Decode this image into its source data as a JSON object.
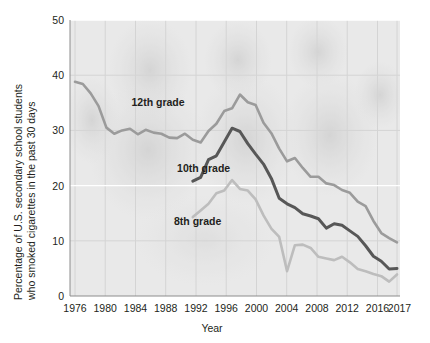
{
  "chart_data": {
    "type": "line",
    "title": "",
    "xlabel": "Year",
    "ylabel": "Percentage of U.S. secondary school students who smoked cigarettes in the past 30 days",
    "xlim": [
      1976,
      2017
    ],
    "ylim": [
      0,
      50
    ],
    "xticks": [
      1976,
      1980,
      1984,
      1988,
      1992,
      1996,
      2000,
      2004,
      2008,
      2012,
      2016,
      2017
    ],
    "xtick_labels": [
      "1976",
      "1980",
      "1984",
      "1988",
      "1992",
      "1996",
      "2000",
      "2004",
      "2008",
      "2012",
      "2016",
      "2017"
    ],
    "yticks": [
      0,
      10,
      20,
      30,
      40,
      50
    ],
    "ytick_labels": [
      "0",
      "10",
      "20",
      "30",
      "40",
      "50"
    ],
    "grid": true,
    "legend_position": "inline-annotations",
    "series": [
      {
        "name": "12th grade",
        "color": "#9b9b9b",
        "label_x": 1983.2,
        "label_y": 34.5,
        "x": [
          1976,
          1977,
          1978,
          1979,
          1980,
          1981,
          1982,
          1983,
          1984,
          1985,
          1986,
          1987,
          1988,
          1989,
          1990,
          1991,
          1992,
          1993,
          1994,
          1995,
          1996,
          1997,
          1998,
          1999,
          2000,
          2001,
          2002,
          2003,
          2004,
          2005,
          2006,
          2007,
          2008,
          2009,
          2010,
          2011,
          2012,
          2013,
          2014,
          2015,
          2016,
          2017
        ],
        "y": [
          38.8,
          38.4,
          36.7,
          34.4,
          30.5,
          29.4,
          30.0,
          30.3,
          29.3,
          30.1,
          29.6,
          29.4,
          28.7,
          28.6,
          29.4,
          28.3,
          27.8,
          29.9,
          31.2,
          33.5,
          34.0,
          36.5,
          35.1,
          34.6,
          31.4,
          29.5,
          26.7,
          24.4,
          25.0,
          23.2,
          21.6,
          21.6,
          20.4,
          20.1,
          19.2,
          18.7,
          17.1,
          16.3,
          13.6,
          11.4,
          10.5,
          9.7
        ]
      },
      {
        "name": "10th grade",
        "color": "#575757",
        "label_x": 1989.0,
        "label_y": 22.5,
        "x": [
          1991,
          1992,
          1993,
          1994,
          1995,
          1996,
          1997,
          1998,
          1999,
          2000,
          2001,
          2002,
          2003,
          2004,
          2005,
          2006,
          2007,
          2008,
          2009,
          2010,
          2011,
          2012,
          2013,
          2014,
          2015,
          2016,
          2017
        ],
        "y": [
          20.8,
          21.5,
          24.7,
          25.4,
          27.9,
          30.4,
          29.8,
          27.6,
          25.7,
          23.9,
          21.3,
          17.7,
          16.7,
          16.0,
          14.9,
          14.5,
          14.0,
          12.3,
          13.1,
          12.8,
          11.8,
          10.8,
          9.1,
          7.2,
          6.3,
          4.9,
          5.0
        ]
      },
      {
        "name": "8th grade",
        "color": "#bdbdbd",
        "label_x": 1988.6,
        "label_y": 12.8,
        "x": [
          1991,
          1992,
          1993,
          1994,
          1995,
          1996,
          1997,
          1998,
          1999,
          2000,
          2001,
          2002,
          2003,
          2004,
          2005,
          2006,
          2007,
          2008,
          2009,
          2010,
          2011,
          2012,
          2013,
          2014,
          2015,
          2016,
          2017
        ],
        "y": [
          14.3,
          15.5,
          16.7,
          18.6,
          19.1,
          21.0,
          19.4,
          19.1,
          17.5,
          14.6,
          12.2,
          10.7,
          4.5,
          9.2,
          9.3,
          8.7,
          7.1,
          6.8,
          6.5,
          7.1,
          6.1,
          4.9,
          4.5,
          4.0,
          3.6,
          2.6,
          3.9
        ]
      }
    ]
  },
  "axes": {
    "x_title": "Year",
    "y_title_line1": "Percentage of U.S. secondary school students",
    "y_title_line2": "who smoked cigarettes in the past 30 days"
  },
  "colors": {
    "grade12": "#9b9b9b",
    "grade10": "#575757",
    "grade8": "#bdbdbd",
    "plot_background": "#e8e8e8",
    "grid": "#d2d2d2",
    "text": "#231f20"
  }
}
